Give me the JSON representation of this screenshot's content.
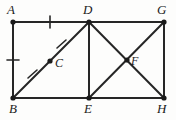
{
  "figure": {
    "type": "geometry-diagram",
    "stroke_color": "#262626",
    "point_color": "#1a1a1a",
    "background_color": "#fdfdfc",
    "stroke_width": 2.0
  },
  "points": [
    {
      "id": "A",
      "label": "A",
      "x": 13,
      "y": 22,
      "label_x": 7,
      "label_y": 3,
      "dot": true
    },
    {
      "id": "D",
      "label": "D",
      "x": 89,
      "y": 22,
      "label_x": 83,
      "label_y": 3,
      "dot": true
    },
    {
      "id": "G",
      "label": "G",
      "x": 164,
      "y": 22,
      "label_x": 157,
      "label_y": 3,
      "dot": true
    },
    {
      "id": "C",
      "label": "C",
      "x": 50,
      "y": 61,
      "label_x": 55,
      "label_y": 57,
      "dot": true
    },
    {
      "id": "F",
      "label": "F",
      "x": 127,
      "y": 60,
      "label_x": 131,
      "label_y": 55,
      "dot": true
    },
    {
      "id": "B",
      "label": "B",
      "x": 13,
      "y": 98,
      "label_x": 9,
      "label_y": 102,
      "dot": true
    },
    {
      "id": "E",
      "label": "E",
      "x": 89,
      "y": 98,
      "label_x": 84,
      "label_y": 102,
      "dot": true
    },
    {
      "id": "H",
      "label": "H",
      "x": 164,
      "y": 98,
      "label_x": 157,
      "label_y": 102,
      "dot": true
    }
  ],
  "segments": [
    {
      "id": "AD",
      "from": "A",
      "to": "D",
      "x1": 13,
      "y1": 22,
      "x2": 89,
      "y2": 22
    },
    {
      "id": "DG",
      "from": "D",
      "to": "G",
      "x1": 89,
      "y1": 22,
      "x2": 164,
      "y2": 22
    },
    {
      "id": "AB",
      "from": "A",
      "to": "B",
      "x1": 13,
      "y1": 22,
      "x2": 13,
      "y2": 98
    },
    {
      "id": "GH",
      "from": "G",
      "to": "H",
      "x1": 164,
      "y1": 22,
      "x2": 164,
      "y2": 98
    },
    {
      "id": "BE",
      "from": "B",
      "to": "E",
      "x1": 13,
      "y1": 98,
      "x2": 89,
      "y2": 98
    },
    {
      "id": "EH",
      "from": "E",
      "to": "H",
      "x1": 89,
      "y1": 98,
      "x2": 164,
      "y2": 98
    },
    {
      "id": "DE",
      "from": "D",
      "to": "E",
      "x1": 89,
      "y1": 22,
      "x2": 89,
      "y2": 98
    },
    {
      "id": "BD",
      "from": "B",
      "to": "D",
      "x1": 13,
      "y1": 98,
      "x2": 89,
      "y2": 22
    },
    {
      "id": "DH",
      "from": "D",
      "to": "H",
      "x1": 89,
      "y1": 22,
      "x2": 164,
      "y2": 98
    },
    {
      "id": "EG",
      "from": "E",
      "to": "G",
      "x1": 89,
      "y1": 98,
      "x2": 164,
      "y2": 22
    }
  ],
  "tick_marks": [
    {
      "id": "tick-AD",
      "on_segment": "AD",
      "x1": 50,
      "y1": 16,
      "x2": 50,
      "y2": 28,
      "note": "single tick on A D"
    },
    {
      "id": "tick-AB",
      "on_segment": "AB",
      "x1": 7,
      "y1": 60,
      "x2": 19,
      "y2": 60,
      "note": "single tick on A B"
    },
    {
      "id": "tick-BC",
      "on_segment": "BD",
      "x1": 28,
      "y1": 78,
      "x2": 37,
      "y2": 70,
      "note": "single tick on B C"
    },
    {
      "id": "tick-CD",
      "on_segment": "BD",
      "x1": 57,
      "y1": 48,
      "x2": 66,
      "y2": 40,
      "note": "single tick on C D"
    }
  ]
}
